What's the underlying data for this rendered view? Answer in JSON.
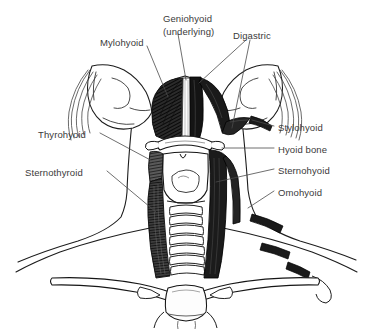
{
  "figure": {
    "kind": "anatomical-illustration",
    "style": "black-and-white pen-and-ink line drawing with hatched shading",
    "background_color": "#ffffff",
    "ink_color": "#1c1c1c",
    "label_text_color": "#3a3a3a",
    "leader_line_color": "#4a4a4a"
  },
  "labels": {
    "mylohyoid": "Mylohyoid",
    "geniohyoid": "Geniohyoid",
    "geniohyoid_note": "(underlying)",
    "digastric": "Digastric",
    "thyrohyoid": "Thyrohyoid",
    "sternothyroid": "Sternothyroid",
    "stylohyoid": "Stylohyoid",
    "hyoid_bone": "Hyoid bone",
    "sternohyoid": "Sternohyoid",
    "omohyoid": "Omohyoid"
  },
  "structures": [
    {
      "name": "mandible",
      "side": "both",
      "rendering": "outline"
    },
    {
      "name": "mylohyoid-muscle",
      "side": "left",
      "rendering": "dense-hatched-dark"
    },
    {
      "name": "geniohyoid-muscle",
      "side": "midline",
      "rendering": "light-strip-underlying"
    },
    {
      "name": "digastric-anterior-belly",
      "side": "right",
      "rendering": "solid-dark-band"
    },
    {
      "name": "digastric-posterior-belly",
      "side": "right",
      "rendering": "solid-dark-band"
    },
    {
      "name": "stylohyoid-muscle",
      "side": "right",
      "rendering": "thin-dark-band"
    },
    {
      "name": "hyoid-bone",
      "side": "midline",
      "rendering": "outline-with-greater-horns"
    },
    {
      "name": "thyroid-cartilage",
      "side": "midline",
      "rendering": "outline-with-notch"
    },
    {
      "name": "thyrohyoid-muscle",
      "side": "left",
      "rendering": "hatched-band"
    },
    {
      "name": "sternothyroid-muscle",
      "side": "left",
      "rendering": "hatched-band"
    },
    {
      "name": "sternohyoid-muscle",
      "side": "right",
      "rendering": "dark-vertical-strap"
    },
    {
      "name": "omohyoid-muscle",
      "side": "right",
      "rendering": "cut-dark-segments-over-shoulder"
    },
    {
      "name": "trachea",
      "side": "midline",
      "rendering": "stacked-cartilage-rings"
    },
    {
      "name": "clavicle",
      "side": "both",
      "rendering": "outline"
    },
    {
      "name": "manubrium-sternum",
      "side": "midline",
      "rendering": "outline"
    }
  ],
  "label_positions": {
    "mylohyoid": {
      "x": 100,
      "y": 37,
      "anchor": "start"
    },
    "geniohyoid": {
      "x": 163,
      "y": 13,
      "anchor": "start"
    },
    "geniohyoid_note": {
      "x": 163,
      "y": 26,
      "anchor": "start"
    },
    "digastric": {
      "x": 233,
      "y": 30,
      "anchor": "start"
    },
    "thyrohyoid": {
      "x": 38,
      "y": 129,
      "anchor": "start"
    },
    "sternothyroid": {
      "x": 25,
      "y": 167,
      "anchor": "start"
    },
    "stylohyoid": {
      "x": 278,
      "y": 122,
      "anchor": "start"
    },
    "hyoid_bone": {
      "x": 278,
      "y": 144,
      "anchor": "start"
    },
    "sternohyoid": {
      "x": 278,
      "y": 165,
      "anchor": "start"
    },
    "omohyoid": {
      "x": 278,
      "y": 187,
      "anchor": "start"
    }
  }
}
